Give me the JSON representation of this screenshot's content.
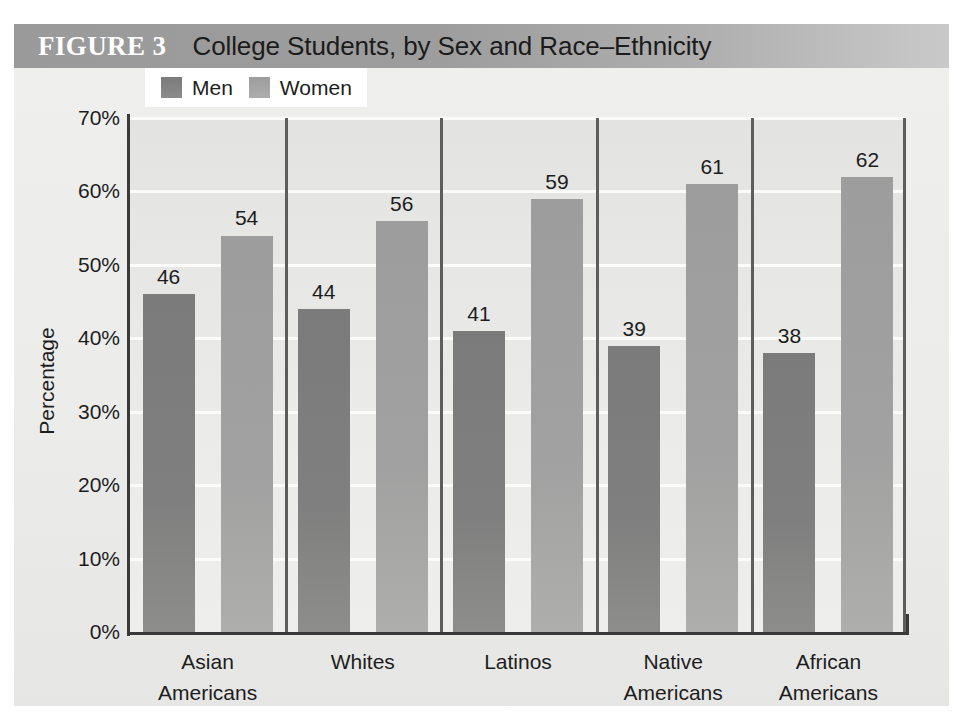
{
  "figure": {
    "label": "FIGURE 3",
    "title": "College Students, by Sex and Race–Ethnicity"
  },
  "legend": {
    "position": "top-left",
    "items": [
      {
        "name": "Men",
        "swatch": "men-swatch",
        "color": "#7f7f7f"
      },
      {
        "name": "Women",
        "swatch": "women-swatch",
        "color": "#a1a1a1"
      }
    ]
  },
  "axes": {
    "ylabel": "Percentage",
    "yticks": [
      "70%",
      "60%",
      "50%",
      "40%",
      "30%",
      "20%",
      "10%",
      "0%"
    ],
    "xlabel": ""
  },
  "chart_data": {
    "type": "bar",
    "title": "College Students, by Sex and Race–Ethnicity",
    "xlabel": "",
    "ylabel": "Percentage",
    "ylim": [
      0,
      70
    ],
    "ytick_values": [
      0,
      10,
      20,
      30,
      40,
      50,
      60,
      70
    ],
    "ytick_labels": [
      "0%",
      "10%",
      "20%",
      "30%",
      "40%",
      "50%",
      "60%",
      "70%"
    ],
    "grid": "horizontal",
    "legend_position": "top-left",
    "categories": [
      "Asian Americans",
      "Whites",
      "Latinos",
      "Native Americans",
      "African Americans"
    ],
    "category_lines": [
      [
        "Asian",
        "Americans"
      ],
      [
        "Whites",
        ""
      ],
      [
        "Latinos",
        ""
      ],
      [
        "Native",
        "Americans"
      ],
      [
        "African",
        "Americans"
      ]
    ],
    "series": [
      {
        "name": "Men",
        "values": [
          46,
          44,
          41,
          39,
          38
        ],
        "color": "#7f7f7f"
      },
      {
        "name": "Women",
        "values": [
          54,
          56,
          59,
          61,
          62
        ],
        "color": "#a1a1a1"
      }
    ],
    "bar_labels": {
      "Men": [
        "46",
        "44",
        "41",
        "39",
        "38"
      ],
      "Women": [
        "54",
        "56",
        "59",
        "61",
        "62"
      ]
    }
  }
}
